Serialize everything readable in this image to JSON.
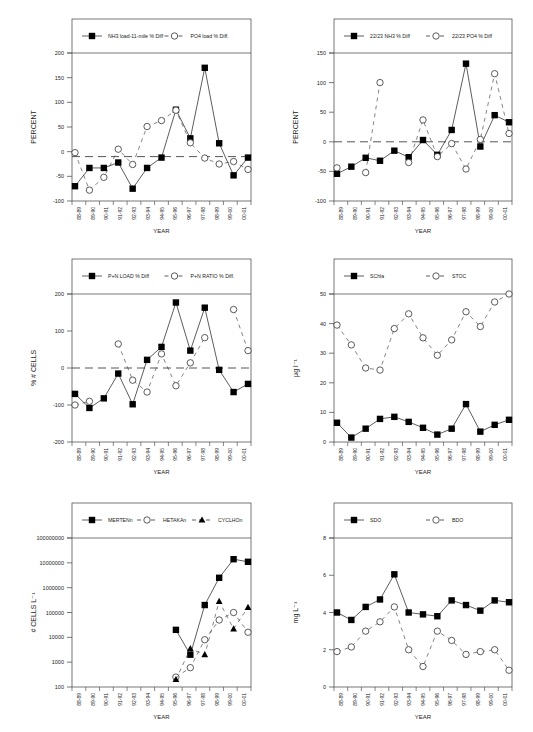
{
  "figure": {
    "years": [
      "88-89",
      "89-90",
      "90-91",
      "91-92",
      "92-93",
      "93-94",
      "94-95",
      "95-96",
      "96-97",
      "97-98",
      "98-99",
      "99-00",
      "00-01"
    ],
    "xlabel": "YEAR",
    "colors": {
      "line": "#333333",
      "marker_fill": "#000000",
      "open_fill": "#ffffff",
      "frame": "#555555"
    }
  },
  "chart_data": [
    {
      "id": "nh3-po4-load",
      "type": "line",
      "title": "",
      "xlabel": "YEAR",
      "ylabel": "PERCENT",
      "categories": [
        "88-89",
        "89-90",
        "90-91",
        "91-92",
        "92-93",
        "93-94",
        "94-95",
        "95-96",
        "96-97",
        "97-98",
        "98-99",
        "99-00",
        "00-01"
      ],
      "ylim": [
        -100,
        200
      ],
      "yticks": [
        -100,
        -50,
        0,
        50,
        100,
        150,
        200
      ],
      "reference_line": -10,
      "legend_position": "top",
      "series": [
        {
          "name": "NH3 load-11-mile % Diff",
          "marker": "filled-square",
          "dash": false,
          "values": [
            -70,
            -33,
            -33,
            -22,
            -75,
            -33,
            -12,
            85,
            27,
            170,
            17,
            -48,
            -12
          ]
        },
        {
          "name": "PO4 load % Diff.",
          "marker": "open-circle",
          "dash": true,
          "values": [
            -2,
            -78,
            -52,
            5,
            -26,
            51,
            63,
            84,
            18,
            -13,
            -25,
            -20,
            -36
          ]
        }
      ]
    },
    {
      "id": "2223-nh3-po4",
      "type": "line",
      "title": "",
      "xlabel": "YEAR",
      "ylabel": "PERCENT",
      "categories": [
        "88-89",
        "89-90",
        "90-91",
        "91-92",
        "92-93",
        "93-94",
        "94-95",
        "95-96",
        "96-97",
        "97-98",
        "98-99",
        "99-00",
        "00-01"
      ],
      "ylim": [
        -100,
        150
      ],
      "yticks": [
        -100,
        -50,
        0,
        50,
        100,
        150
      ],
      "reference_line": 0,
      "legend_position": "top",
      "series": [
        {
          "name": "22/23 NH3 % Diff",
          "marker": "filled-square",
          "dash": false,
          "values": [
            -54,
            -42,
            -27,
            -32,
            -15,
            -26,
            3,
            -22,
            20,
            132,
            -8,
            45,
            33
          ]
        },
        {
          "name": "22/23 PO4 % Diff",
          "marker": "open-circle",
          "dash": true,
          "values": [
            -44,
            null,
            -52,
            100,
            null,
            -35,
            37,
            -25,
            -3,
            -46,
            4,
            115,
            14
          ]
        }
      ]
    },
    {
      "id": "pn-load-ratio",
      "type": "line",
      "title": "",
      "xlabel": "YEAR",
      "ylabel": "% # CELLS",
      "categories": [
        "88-89",
        "89-90",
        "90-91",
        "91-92",
        "92-93",
        "93-94",
        "94-95",
        "95-96",
        "96-97",
        "97-98",
        "98-99",
        "99-00",
        "00-01"
      ],
      "ylim": [
        -200,
        200
      ],
      "yticks": [
        -200,
        -100,
        0,
        100,
        200
      ],
      "reference_line": 0,
      "legend_position": "top",
      "series": [
        {
          "name": "P+N LOAD % Diff",
          "marker": "filled-square",
          "dash": false,
          "values": [
            -70,
            -108,
            -82,
            -15,
            -98,
            22,
            57,
            177,
            47,
            163,
            -5,
            -65,
            -43
          ]
        },
        {
          "name": "P+N RATIO % Diff.",
          "marker": "open-circle",
          "dash": true,
          "values": [
            -100,
            -90,
            null,
            65,
            -33,
            -65,
            38,
            -48,
            14,
            82,
            null,
            158,
            47
          ]
        }
      ]
    },
    {
      "id": "schla-stoc",
      "type": "line",
      "title": "",
      "xlabel": "YEAR",
      "ylabel": "μg l⁻¹",
      "categories": [
        "88-89",
        "89-90",
        "90-91",
        "91-92",
        "92-93",
        "93-94",
        "94-95",
        "95-96",
        "96-97",
        "97-98",
        "98-99",
        "99-00",
        "00-01"
      ],
      "ylim": [
        0,
        50
      ],
      "yticks": [
        0,
        10,
        20,
        30,
        40,
        50
      ],
      "reference_line": null,
      "legend_position": "top",
      "series": [
        {
          "name": "SChla",
          "marker": "filled-square",
          "dash": false,
          "values": [
            6.5,
            1.5,
            4.5,
            7.8,
            8.5,
            6.8,
            4.8,
            2.5,
            4.5,
            12.8,
            3.5,
            5.8,
            7.5
          ]
        },
        {
          "name": "STOC",
          "marker": "open-circle",
          "dash": true,
          "values": [
            39.5,
            32.8,
            25,
            24.3,
            38.3,
            43.3,
            35.2,
            29.3,
            34.5,
            44,
            39,
            47.3,
            50
          ]
        }
      ]
    },
    {
      "id": "algae-cells",
      "type": "line",
      "title": "",
      "xlabel": "YEAR",
      "ylabel": "# CELLS L⁻¹",
      "yscale": "log",
      "categories": [
        "88-89",
        "89-90",
        "90-91",
        "91-92",
        "92-93",
        "93-94",
        "94-95",
        "95-96",
        "96-97",
        "97-98",
        "98-99",
        "99-00",
        "00-01"
      ],
      "ylim": [
        100,
        100000000
      ],
      "yticks": [
        100,
        1000,
        10000,
        100000,
        1000000,
        10000000,
        100000000
      ],
      "reference_line": null,
      "legend_position": "top",
      "series": [
        {
          "name": "MERTENn",
          "marker": "filled-square",
          "dash": false,
          "values": [
            null,
            null,
            null,
            null,
            null,
            null,
            null,
            20000,
            2000,
            200000,
            2500000,
            14000000,
            11000000
          ]
        },
        {
          "name": "HETAKAn",
          "marker": "open-circle",
          "dash": true,
          "values": [
            null,
            null,
            null,
            null,
            null,
            null,
            null,
            250,
            600,
            8000,
            50000,
            100000,
            16000
          ]
        },
        {
          "name": "CYCLHOn",
          "marker": "filled-triangle",
          "dash": true,
          "values": [
            null,
            null,
            null,
            null,
            null,
            null,
            null,
            200,
            3500,
            2000,
            280000,
            22000,
            160000
          ]
        }
      ]
    },
    {
      "id": "sdo-bdo",
      "type": "line",
      "title": "",
      "xlabel": "YEAR",
      "ylabel": "mg L⁻¹",
      "categories": [
        "88-89",
        "89-90",
        "90-91",
        "91-92",
        "92-93",
        "93-94",
        "94-95",
        "95-96",
        "96-97",
        "97-98",
        "98-99",
        "99-00",
        "00-01"
      ],
      "ylim": [
        0,
        8
      ],
      "yticks": [
        0,
        2,
        4,
        6,
        8
      ],
      "reference_line": null,
      "legend_position": "top",
      "series": [
        {
          "name": "SDO",
          "marker": "filled-square",
          "dash": false,
          "values": [
            4.0,
            3.6,
            4.3,
            4.7,
            6.05,
            4.0,
            3.9,
            3.8,
            4.65,
            4.4,
            4.1,
            4.65,
            4.55
          ]
        },
        {
          "name": "BDO",
          "marker": "open-circle",
          "dash": true,
          "values": [
            1.9,
            2.15,
            3.0,
            3.5,
            4.3,
            2.0,
            1.1,
            3.0,
            2.5,
            1.75,
            1.9,
            2.0,
            0.9
          ]
        }
      ]
    }
  ],
  "layout_panels": [
    {
      "x": 72,
      "top": 19,
      "legendBottom": 53,
      "axisBottom": 201,
      "right": 251
    },
    {
      "x": 334,
      "top": 19,
      "legendBottom": 53,
      "axisBottom": 201,
      "right": 512
    },
    {
      "x": 72,
      "top": 259,
      "legendBottom": 294,
      "axisBottom": 442,
      "right": 251
    },
    {
      "x": 334,
      "top": 259,
      "legendBottom": 294,
      "axisBottom": 442,
      "right": 512
    },
    {
      "x": 72,
      "top": 503,
      "legendBottom": 538,
      "axisBottom": 687,
      "right": 251
    },
    {
      "x": 334,
      "top": 503,
      "legendBottom": 538,
      "axisBottom": 687,
      "right": 512
    }
  ]
}
